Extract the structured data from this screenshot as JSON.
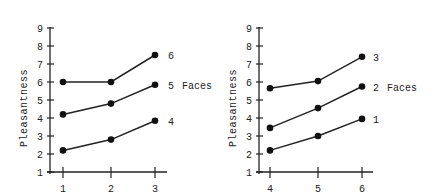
{
  "chart_data": [
    {
      "type": "line",
      "title": "",
      "xlabel": "",
      "ylabel": "Pleasantness",
      "ylim": [
        1,
        9
      ],
      "yticks": [
        "1",
        "2",
        "3",
        "4",
        "5",
        "6",
        "7",
        "8",
        "9"
      ],
      "categories": [
        "1",
        "2",
        "3"
      ],
      "legend_title": "Faces",
      "series": [
        {
          "name": "6",
          "values": [
            6.0,
            6.0,
            7.5
          ]
        },
        {
          "name": "5",
          "values": [
            4.2,
            4.8,
            5.85
          ]
        },
        {
          "name": "4",
          "values": [
            2.2,
            2.8,
            3.85
          ]
        }
      ],
      "grid": false
    },
    {
      "type": "line",
      "title": "",
      "xlabel": "",
      "ylabel": "Pleasantness",
      "ylim": [
        1,
        9
      ],
      "yticks": [
        "1",
        "2",
        "3",
        "4",
        "5",
        "6",
        "7",
        "8",
        "9"
      ],
      "categories": [
        "4",
        "5",
        "6"
      ],
      "legend_title": "Faces",
      "series": [
        {
          "name": "3",
          "values": [
            5.65,
            6.05,
            7.4
          ]
        },
        {
          "name": "2",
          "values": [
            3.45,
            4.55,
            5.75
          ]
        },
        {
          "name": "1",
          "values": [
            2.2,
            3.0,
            3.95
          ]
        }
      ],
      "grid": false
    }
  ]
}
